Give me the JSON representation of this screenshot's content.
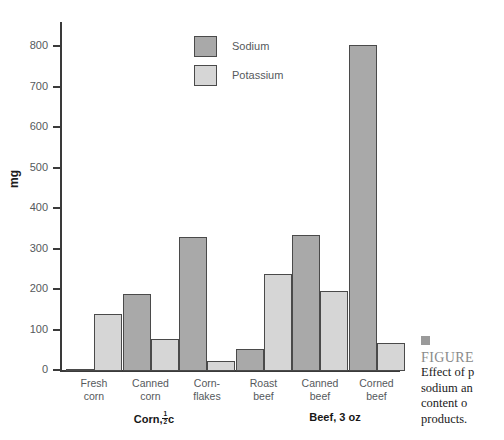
{
  "chart_data": {
    "type": "bar",
    "title": "",
    "xlabel": "",
    "ylabel": "mg",
    "ylim": [
      0,
      850
    ],
    "yticks": [
      0,
      100,
      200,
      300,
      400,
      500,
      600,
      700,
      800
    ],
    "grid": false,
    "legend_position": "top-center",
    "categories": [
      "Fresh corn",
      "Canned corn",
      "Corn-flakes",
      "Roast beef",
      "Canned beef",
      "Corned beef"
    ],
    "category_lines": [
      [
        "Fresh",
        "corn"
      ],
      [
        "Canned",
        "corn"
      ],
      [
        "Corn-",
        "flakes"
      ],
      [
        "Roast",
        "beef"
      ],
      [
        "Canned",
        "beef"
      ],
      [
        "Corned",
        "beef"
      ]
    ],
    "groups": [
      {
        "label_prefix": "Corn,",
        "label_suffix": "c",
        "fraction_num": "1",
        "fraction_den": "2",
        "span": [
          0,
          2
        ]
      },
      {
        "label_prefix": "Beef, 3 oz",
        "label_suffix": "",
        "fraction_num": "",
        "fraction_den": "",
        "span": [
          3,
          5
        ]
      }
    ],
    "series": [
      {
        "name": "Sodium",
        "color": "#a9a9a9",
        "values": [
          5,
          190,
          330,
          55,
          335,
          805
        ]
      },
      {
        "name": "Potassium",
        "color": "#d6d6d6",
        "values": [
          140,
          80,
          25,
          240,
          197,
          70
        ]
      }
    ]
  },
  "legend": {
    "items": [
      {
        "label": "Sodium",
        "color": "#a9a9a9"
      },
      {
        "label": "Potassium",
        "color": "#d6d6d6"
      }
    ]
  },
  "axis": {
    "y_title": "mg",
    "tick_labels": [
      "800",
      "700",
      "600",
      "500",
      "400",
      "300",
      "200",
      "100",
      "0"
    ]
  },
  "group_labels": {
    "corn_prefix": "Corn,",
    "corn_num": "1",
    "corn_den": "2",
    "corn_suffix": "c",
    "beef": "Beef, 3 oz"
  },
  "caption": {
    "title": "FIGURE",
    "line1": "Effect of p",
    "line2": "sodium an",
    "line3": "content o",
    "line4": "products."
  }
}
